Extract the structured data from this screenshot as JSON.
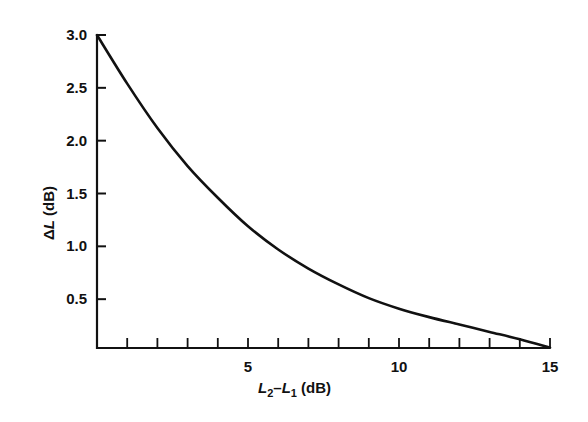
{
  "chart_data": {
    "type": "line",
    "title": "",
    "xlabel": "L2−L1 (dB)",
    "ylabel": "ΔL (dB)",
    "xlabel_parts": {
      "a": "L",
      "a_sub": "2",
      "dash": "–",
      "b": "L",
      "b_sub": "1",
      "unit": " (dB)"
    },
    "ylabel_parts": {
      "delta": "Δ",
      "var": "L",
      "unit": " (dB)"
    },
    "xlim": [
      0,
      15
    ],
    "ylim": [
      0,
      3.0
    ],
    "x_tick_labels": [
      "5",
      "10",
      "15"
    ],
    "x_tick_label_values": [
      5,
      10,
      15
    ],
    "x_minor_ticks": [
      1,
      2,
      3,
      4,
      5,
      6,
      7,
      8,
      9,
      10,
      11,
      12,
      13,
      14,
      15
    ],
    "y_tick_labels": [
      "0.5",
      "1.0",
      "1.5",
      "2.0",
      "2.5",
      "3.0"
    ],
    "y_tick_values": [
      0.5,
      1.0,
      1.5,
      2.0,
      2.5,
      3.0
    ],
    "grid": false,
    "legend": null,
    "series": [
      {
        "name": "ΔL",
        "x": [
          0,
          1,
          2,
          3,
          4,
          5,
          6,
          7,
          8,
          9,
          10,
          11,
          12,
          13,
          14,
          15
        ],
        "values": [
          3.0,
          2.54,
          2.12,
          1.76,
          1.46,
          1.19,
          0.97,
          0.79,
          0.64,
          0.51,
          0.41,
          0.33,
          0.26,
          0.19,
          0.12,
          0.04
        ]
      }
    ],
    "colors": {
      "line": "#111111",
      "axis": "#111111",
      "background": "#ffffff"
    }
  }
}
